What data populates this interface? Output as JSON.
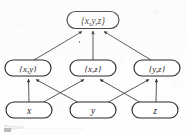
{
  "figure": {
    "kind": "hasse-diagram",
    "ink_color": "#2b2b2b",
    "background_color": "#fdfdfd",
    "caption_partial": "Figure . . . . . . . . . . . . . . ."
  },
  "levels": {
    "top": {
      "nodes": [
        {
          "id": "xyz",
          "label": "{x,y,z}",
          "cx": 93,
          "cy": 20,
          "w": 52,
          "h": 17,
          "font_size": 9.5
        }
      ]
    },
    "middle": {
      "nodes": [
        {
          "id": "xy",
          "label": "{x,y}",
          "cx": 28,
          "cy": 68,
          "w": 46,
          "h": 16,
          "font_size": 9
        },
        {
          "id": "xz",
          "label": "{x,z}",
          "cx": 93,
          "cy": 68,
          "w": 46,
          "h": 16,
          "font_size": 9
        },
        {
          "id": "yz",
          "label": "{y,z}",
          "cx": 157,
          "cy": 68,
          "w": 46,
          "h": 16,
          "font_size": 9
        }
      ]
    },
    "bottom": {
      "nodes": [
        {
          "id": "x",
          "label": "x",
          "cx": 29,
          "cy": 110,
          "w": 46,
          "h": 16,
          "font_size": 9.5
        },
        {
          "id": "y",
          "label": "y",
          "cx": 93,
          "cy": 110,
          "w": 46,
          "h": 16,
          "font_size": 9.5
        },
        {
          "id": "z",
          "label": "z",
          "cx": 155,
          "cy": 110,
          "w": 46,
          "h": 16,
          "font_size": 9.5
        }
      ]
    }
  },
  "edges": [
    {
      "from": "xy",
      "to": "xyz"
    },
    {
      "from": "xz",
      "to": "xyz"
    },
    {
      "from": "yz",
      "to": "xyz"
    },
    {
      "from": "x",
      "to": "xy"
    },
    {
      "from": "x",
      "to": "xz"
    },
    {
      "from": "y",
      "to": "xy"
    },
    {
      "from": "y",
      "to": "yz"
    },
    {
      "from": "z",
      "to": "xz"
    },
    {
      "from": "z",
      "to": "yz"
    }
  ],
  "labels": {
    "xyz": "{x,y,z}",
    "xy": "{x,y}",
    "xz": "{x,z}",
    "yz": "{y,z}",
    "x": "x",
    "y": "y",
    "z": "z"
  }
}
